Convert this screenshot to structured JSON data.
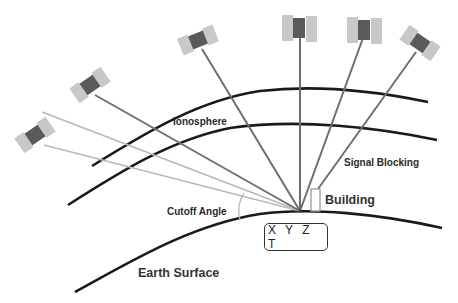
{
  "labels": {
    "ionosphere": "Ionosphere",
    "signal_blocking": "Signal Blocking",
    "building": "Building",
    "cutoff_angle": "Cutoff Angle",
    "earth_surface": "Earth Surface",
    "receiver_position": "X Y Z T"
  },
  "satellites": [
    {
      "id": "sat-1",
      "x": 35,
      "y": 135,
      "angle": -35,
      "signal": "below-cutoff"
    },
    {
      "id": "sat-2",
      "x": 90,
      "y": 85,
      "angle": -35,
      "signal": "received"
    },
    {
      "id": "sat-3",
      "x": 198,
      "y": 40,
      "angle": -22,
      "signal": "received"
    },
    {
      "id": "sat-4",
      "x": 299,
      "y": 28,
      "angle": 0,
      "signal": "received"
    },
    {
      "id": "sat-5",
      "x": 364,
      "y": 30,
      "angle": 0,
      "signal": "received"
    },
    {
      "id": "sat-6",
      "x": 420,
      "y": 43,
      "angle": 30,
      "signal": "blocked"
    }
  ],
  "colors": {
    "layer_line": "#1a1a1a",
    "signal_line": "#6e6e6e",
    "weak_signal_line": "#b4b4b4",
    "panel": "#c8c8c8",
    "body": "#5a5a5a"
  }
}
